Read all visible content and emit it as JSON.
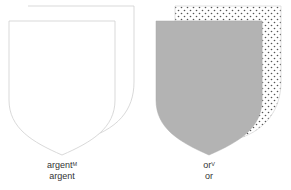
{
  "panels": [
    {
      "name": "argent",
      "label_line1": "argent",
      "label_superscript": "M",
      "label_line2": "argent",
      "fill": "#ffffff",
      "stroke": "#c8c8c8",
      "back_pattern": "none"
    },
    {
      "name": "or",
      "label_line1": "or",
      "label_superscript": "V",
      "label_line2": "or",
      "fill": "#b3b3b3",
      "stroke": "#c8c8c8",
      "back_pattern": "dots"
    }
  ]
}
